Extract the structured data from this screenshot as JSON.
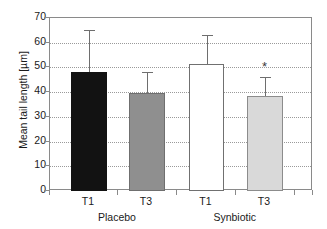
{
  "chart_data": {
    "type": "bar",
    "title": "",
    "xlabel": "",
    "ylabel": "Mean tail length [µm]",
    "ylim": [
      0,
      70
    ],
    "ytick_values": [
      70,
      60,
      50,
      40,
      30,
      20,
      10,
      0
    ],
    "ytick_labels": [
      "70",
      "60",
      "50",
      "40",
      "30",
      "20",
      "10",
      "0"
    ],
    "grid": "horizontal-dotted",
    "legend": "none",
    "categories": [
      "T1",
      "T3",
      "T1",
      "T3"
    ],
    "groups": [
      {
        "label": "Placebo",
        "categories": [
          "T1",
          "T3"
        ]
      },
      {
        "label": "Synbiotic",
        "categories": [
          "T1",
          "T3"
        ]
      }
    ],
    "bars": [
      {
        "group": "Placebo",
        "category": "T1",
        "value": 48.0,
        "error_upper": 65.0,
        "fill": "#121212",
        "fill_name": "black",
        "annotation": ""
      },
      {
        "group": "Placebo",
        "category": "T3",
        "value": 39.5,
        "error_upper": 48.0,
        "fill": "#8f8f8f",
        "fill_name": "gray",
        "annotation": ""
      },
      {
        "group": "Synbiotic",
        "category": "T1",
        "value": 51.2,
        "error_upper": 63.0,
        "fill": "#ffffff",
        "fill_name": "white",
        "annotation": ""
      },
      {
        "group": "Synbiotic",
        "category": "T3",
        "value": 38.6,
        "error_upper": 46.0,
        "fill": "#d9d9d9",
        "fill_name": "light-gray",
        "annotation": "*"
      }
    ],
    "values": [
      48.0,
      39.5,
      51.2,
      38.6
    ],
    "error_upper": [
      65.0,
      48.0,
      63.0,
      46.0
    ],
    "annotations": [
      "",
      "",
      "",
      "*"
    ]
  },
  "axis": {
    "frame_color": "#8a8a8a",
    "grid_color": "#9a9a9a",
    "text_color": "#1a1a1a"
  }
}
